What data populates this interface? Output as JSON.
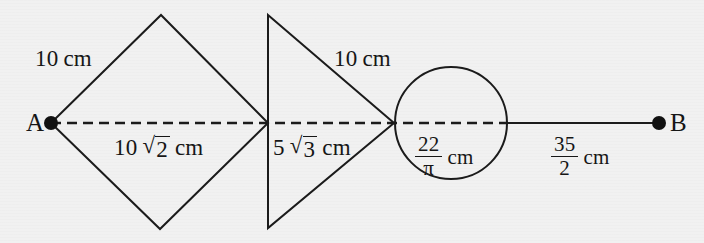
{
  "figure": {
    "background_color": "#f1f1f1",
    "stroke_color": "#1b1b1b",
    "points": {
      "a_label": "A",
      "b_label": "B"
    },
    "labels": {
      "diamond_side": {
        "value": "10",
        "unit": "cm",
        "text": "10 cm"
      },
      "diamond_diagonal": {
        "coefficient": "10",
        "radicand": "2",
        "unit": "cm",
        "text": "10 √2 cm"
      },
      "triangle_height": {
        "coefficient": "5",
        "radicand": "3",
        "unit": "cm",
        "text": "5 √3 cm"
      },
      "triangle_side": {
        "value": "10",
        "unit": "cm",
        "text": "10 cm"
      },
      "circle_diameter": {
        "numerator": "22",
        "denominator": "π",
        "unit": "cm",
        "text": "22/π cm"
      },
      "segment_to_b": {
        "numerator": "35",
        "denominator": "2",
        "unit": "cm",
        "text": "35/2 cm"
      }
    },
    "geometry": {
      "axis_y": 123,
      "point_a_x": 51,
      "diamond_left_x": 51,
      "diamond_top": [
        161,
        15
      ],
      "diamond_bottom": [
        160,
        229
      ],
      "diamond_right_x": 268,
      "triangle_vertical_x": 268,
      "triangle_top_y": 15,
      "triangle_bottom_y": 228,
      "triangle_apex_x": 394,
      "circle_center": [
        451,
        123
      ],
      "circle_radius": 56,
      "point_b_x": 659,
      "dot_radius": 7
    }
  }
}
